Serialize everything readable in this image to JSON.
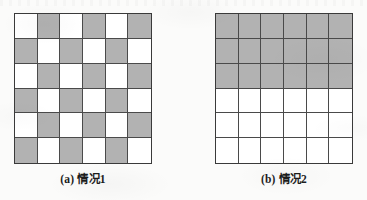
{
  "figure": {
    "background_color": "#fbfbfa",
    "shaded_color": "#b2b2b2",
    "unshaded_color": "#ffffff",
    "grid_line_color": "#4a4a4a",
    "border_color": "#3a3a3a",
    "rows": 6,
    "columns": 6,
    "panels": [
      {
        "id": "a",
        "caption": "(a) 情况1",
        "label": "(a)",
        "name": "情况1",
        "pattern": "checkerboard",
        "grid": [
          [
            0,
            1,
            0,
            1,
            0,
            1
          ],
          [
            1,
            0,
            1,
            0,
            1,
            0
          ],
          [
            0,
            1,
            0,
            1,
            0,
            1
          ],
          [
            1,
            0,
            1,
            0,
            1,
            0
          ],
          [
            0,
            1,
            0,
            1,
            0,
            1
          ],
          [
            1,
            0,
            1,
            0,
            1,
            0
          ]
        ],
        "shaded_count": 18,
        "unshaded_count": 18
      },
      {
        "id": "b",
        "caption": "(b) 情况2",
        "label": "(b)",
        "name": "情况2",
        "pattern": "top-half-band",
        "grid": [
          [
            1,
            1,
            1,
            1,
            1,
            1
          ],
          [
            1,
            1,
            1,
            1,
            1,
            1
          ],
          [
            1,
            1,
            1,
            1,
            1,
            1
          ],
          [
            0,
            0,
            0,
            0,
            0,
            0
          ],
          [
            0,
            0,
            0,
            0,
            0,
            0
          ],
          [
            0,
            0,
            0,
            0,
            0,
            0
          ]
        ],
        "shaded_count": 18,
        "unshaded_count": 18
      }
    ]
  }
}
